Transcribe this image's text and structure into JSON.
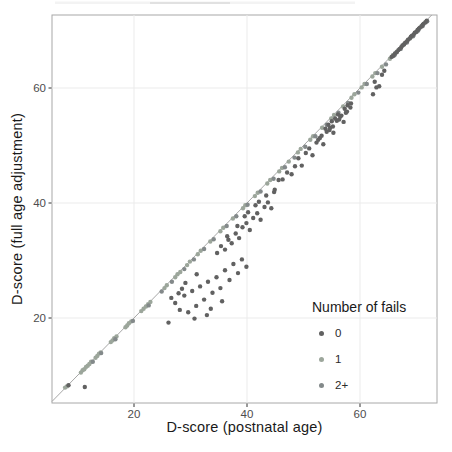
{
  "chart_data": {
    "type": "scatter",
    "title": "",
    "xlabel": "D-score (postnatal age)",
    "ylabel": "D-score (full age adjustment)",
    "x_ticks": [
      "20",
      "40",
      "60"
    ],
    "y_ticks": [
      "20",
      "40",
      "60"
    ],
    "x_tick_values": [
      20,
      40,
      60
    ],
    "y_tick_values": [
      20,
      40,
      60
    ],
    "xlim": [
      5.5,
      73.6
    ],
    "ylim": [
      5.2,
      72.7
    ],
    "grid": "major-only",
    "reference_line": {
      "type": "identity",
      "equation": "y = x",
      "color": "#9c9c9c"
    },
    "legend": {
      "title": "Number of fails",
      "position": "inside-bottom-right",
      "entries": [
        "0",
        "1",
        "2+"
      ]
    },
    "colors": {
      "fails_0": "#616161",
      "fails_1": "#9CA69B",
      "fails_2plus": "#83898A",
      "grid": "#ebebeb",
      "panel_border": "#a8a8a8",
      "tick_label": "#4d4d4d",
      "axis_title": "#1a1a1a"
    },
    "series": [
      {
        "name": "0",
        "color": "#616161",
        "points": [
          [
            65.6,
            65.4
          ],
          [
            65.9,
            65.6
          ],
          [
            66.2,
            66.0
          ],
          [
            66.5,
            66.2
          ],
          [
            66.8,
            66.6
          ],
          [
            67.0,
            66.8
          ],
          [
            67.3,
            67.1
          ],
          [
            67.5,
            67.4
          ],
          [
            67.8,
            67.6
          ],
          [
            68.0,
            67.9
          ],
          [
            68.3,
            68.1
          ],
          [
            68.5,
            68.4
          ],
          [
            68.8,
            68.6
          ],
          [
            69.0,
            68.9
          ],
          [
            69.2,
            69.1
          ],
          [
            69.5,
            69.3
          ],
          [
            69.7,
            69.6
          ],
          [
            70.0,
            69.8
          ],
          [
            70.2,
            70.1
          ],
          [
            70.4,
            70.3
          ],
          [
            70.6,
            70.5
          ],
          [
            70.9,
            70.7
          ],
          [
            71.1,
            71.0
          ],
          [
            71.3,
            71.2
          ],
          [
            71.6,
            71.4
          ],
          [
            71.8,
            71.7
          ],
          [
            62.3,
            58.9
          ],
          [
            62.9,
            60.1
          ],
          [
            63.4,
            60.3
          ],
          [
            62.6,
            61.1
          ],
          [
            63.9,
            62.3
          ],
          [
            64.3,
            63.0
          ],
          [
            44.9,
            42.3
          ],
          [
            45.6,
            44.0
          ],
          [
            46.3,
            44.1
          ],
          [
            47.1,
            45.3
          ],
          [
            47.9,
            45.0
          ],
          [
            48.5,
            46.4
          ],
          [
            49.1,
            47.8
          ],
          [
            49.7,
            46.5
          ],
          [
            50.4,
            48.7
          ],
          [
            51.0,
            49.5
          ],
          [
            51.6,
            48.3
          ],
          [
            52.3,
            50.5
          ],
          [
            52.9,
            51.3
          ],
          [
            53.5,
            50.2
          ],
          [
            54.1,
            52.4
          ],
          [
            54.7,
            53.1
          ],
          [
            55.3,
            52.2
          ],
          [
            55.9,
            54.3
          ],
          [
            56.5,
            55.0
          ],
          [
            57.1,
            54.1
          ],
          [
            57.7,
            55.9
          ],
          [
            58.3,
            56.6
          ],
          [
            53.9,
            52.9
          ],
          [
            54.4,
            53.6
          ],
          [
            55.0,
            54.2
          ],
          [
            55.6,
            54.7
          ],
          [
            56.1,
            55.4
          ],
          [
            56.7,
            55.2
          ],
          [
            57.3,
            56.4
          ],
          [
            57.8,
            57.0
          ],
          [
            58.4,
            57.3
          ],
          [
            55.2,
            53.3
          ],
          [
            56.3,
            54.5
          ],
          [
            54.6,
            52.7
          ],
          [
            57.5,
            55.7
          ],
          [
            53.2,
            51.7
          ],
          [
            52.6,
            51.0
          ],
          [
            34.7,
            31.3
          ],
          [
            35.4,
            32.5
          ],
          [
            36.1,
            31.9
          ],
          [
            36.7,
            33.6
          ],
          [
            37.3,
            33.0
          ],
          [
            38.0,
            34.7
          ],
          [
            38.6,
            33.9
          ],
          [
            39.2,
            35.8
          ],
          [
            39.9,
            36.5
          ],
          [
            40.5,
            35.3
          ],
          [
            41.1,
            37.4
          ],
          [
            41.8,
            38.2
          ],
          [
            42.4,
            37.1
          ],
          [
            43.1,
            39.3
          ],
          [
            43.7,
            40.1
          ],
          [
            44.3,
            39.1
          ],
          [
            38.3,
            36.0
          ],
          [
            40.2,
            38.4
          ],
          [
            36.5,
            34.2
          ],
          [
            42.1,
            40.2
          ],
          [
            39.6,
            37.7
          ],
          [
            41.5,
            39.6
          ],
          [
            43.4,
            41.3
          ],
          [
            44.8,
            41.9
          ],
          [
            27.3,
            22.6
          ],
          [
            28.1,
            21.4
          ],
          [
            28.9,
            23.9
          ],
          [
            29.6,
            21.0
          ],
          [
            30.3,
            24.7
          ],
          [
            31.0,
            22.1
          ],
          [
            31.7,
            25.5
          ],
          [
            32.4,
            23.2
          ],
          [
            33.1,
            26.3
          ],
          [
            33.9,
            24.4
          ],
          [
            34.6,
            27.1
          ],
          [
            35.3,
            25.2
          ],
          [
            36.1,
            28.3
          ],
          [
            36.9,
            26.6
          ],
          [
            37.6,
            29.4
          ],
          [
            38.4,
            27.8
          ],
          [
            39.1,
            30.2
          ],
          [
            39.9,
            28.9
          ],
          [
            29.1,
            26.1
          ],
          [
            31.1,
            27.6
          ],
          [
            33.6,
            21.6
          ],
          [
            35.6,
            22.9
          ],
          [
            28.5,
            25.1
          ],
          [
            30.7,
            19.9
          ],
          [
            32.9,
            20.5
          ],
          [
            26.6,
            23.5
          ],
          [
            27.9,
            24.3
          ],
          [
            11.3,
            8.0
          ],
          [
            26.1,
            19.2
          ],
          [
            8.4,
            8.3
          ]
        ]
      },
      {
        "name": "1",
        "color": "#9CA69B",
        "points": [
          [
            7.8,
            7.9
          ],
          [
            8.1,
            8.1
          ],
          [
            10.6,
            10.5
          ],
          [
            10.9,
            10.9
          ],
          [
            11.2,
            11.1
          ],
          [
            11.5,
            11.5
          ],
          [
            11.8,
            11.7
          ],
          [
            12.1,
            12.0
          ],
          [
            12.4,
            12.4
          ],
          [
            13.2,
            13.1
          ],
          [
            13.5,
            13.4
          ],
          [
            13.8,
            13.8
          ],
          [
            14.1,
            14.0
          ],
          [
            15.9,
            15.8
          ],
          [
            16.2,
            16.1
          ],
          [
            16.5,
            16.5
          ],
          [
            16.9,
            16.8
          ],
          [
            18.5,
            18.4
          ],
          [
            18.8,
            18.7
          ],
          [
            19.1,
            19.1
          ],
          [
            19.5,
            19.4
          ],
          [
            21.3,
            21.2
          ],
          [
            21.7,
            21.6
          ],
          [
            22.1,
            22.0
          ],
          [
            22.5,
            22.4
          ],
          [
            22.9,
            22.8
          ],
          [
            25.4,
            25.2
          ],
          [
            25.8,
            25.7
          ],
          [
            27.3,
            27.1
          ],
          [
            27.7,
            27.6
          ],
          [
            28.2,
            28.0
          ],
          [
            29.4,
            29.2
          ],
          [
            29.9,
            29.8
          ],
          [
            31.3,
            31.1
          ],
          [
            31.8,
            31.7
          ],
          [
            33.5,
            33.3
          ],
          [
            35.3,
            35.1
          ],
          [
            35.8,
            35.7
          ],
          [
            37.5,
            37.3
          ],
          [
            39.3,
            39.1
          ],
          [
            39.7,
            39.6
          ],
          [
            41.4,
            41.2
          ],
          [
            41.9,
            41.8
          ],
          [
            43.6,
            43.4
          ],
          [
            44.1,
            44.0
          ],
          [
            45.7,
            45.5
          ],
          [
            46.2,
            46.1
          ],
          [
            47.4,
            47.2
          ],
          [
            49.0,
            48.8
          ],
          [
            49.5,
            49.4
          ],
          [
            51.2,
            51.0
          ],
          [
            51.7,
            51.6
          ],
          [
            53.3,
            53.1
          ],
          [
            54.9,
            54.7
          ],
          [
            55.4,
            55.3
          ],
          [
            57.0,
            56.8
          ],
          [
            58.5,
            58.3
          ],
          [
            59.0,
            58.9
          ],
          [
            60.3,
            60.1
          ],
          [
            60.8,
            60.7
          ],
          [
            62.2,
            62.0
          ],
          [
            62.7,
            62.6
          ],
          [
            63.9,
            63.7
          ],
          [
            65.3,
            65.1
          ],
          [
            65.8,
            65.7
          ],
          [
            66.5,
            66.3
          ],
          [
            67.7,
            67.5
          ],
          [
            68.9,
            68.7
          ],
          [
            70.0,
            69.8
          ],
          [
            70.9,
            70.8
          ],
          [
            71.6,
            71.5
          ]
        ]
      },
      {
        "name": "2+",
        "color": "#83898A",
        "points": [
          [
            12.7,
            12.4
          ],
          [
            14.2,
            13.9
          ],
          [
            16.7,
            16.3
          ],
          [
            19.8,
            19.5
          ],
          [
            22.6,
            22.2
          ],
          [
            24.9,
            24.6
          ],
          [
            26.7,
            26.3
          ],
          [
            28.9,
            28.5
          ],
          [
            30.6,
            30.2
          ],
          [
            32.4,
            32.0
          ],
          [
            34.1,
            33.7
          ],
          [
            36.4,
            36.0
          ],
          [
            38.1,
            37.7
          ],
          [
            40.1,
            39.7
          ],
          [
            42.4,
            42.0
          ],
          [
            44.7,
            44.2
          ],
          [
            46.7,
            46.2
          ],
          [
            48.4,
            47.9
          ],
          [
            50.3,
            49.8
          ],
          [
            52.1,
            51.6
          ],
          [
            54.1,
            53.6
          ],
          [
            56.2,
            55.7
          ],
          [
            57.9,
            57.4
          ],
          [
            59.7,
            59.2
          ],
          [
            61.2,
            60.7
          ],
          [
            63.1,
            62.6
          ],
          [
            64.6,
            64.1
          ],
          [
            66.1,
            65.7
          ],
          [
            67.2,
            66.8
          ],
          [
            68.3,
            67.9
          ],
          [
            69.4,
            69.0
          ],
          [
            70.3,
            70.0
          ],
          [
            71.1,
            70.8
          ],
          [
            71.9,
            71.6
          ]
        ]
      }
    ]
  }
}
